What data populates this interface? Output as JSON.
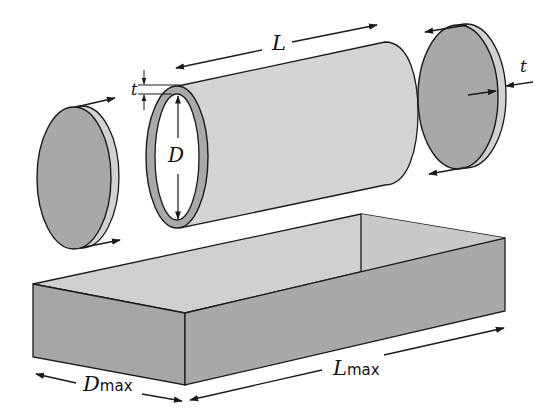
{
  "diagram": {
    "type": "exploded cylinder and bounding box",
    "labels": {
      "length": "L",
      "thickness_left": "t",
      "diameter": "D",
      "thickness_right": "t",
      "dmax_main": "D",
      "dmax_sub": "max",
      "lmax_main": "L",
      "lmax_sub": "max"
    },
    "components": [
      "left end disc",
      "hollow cylinder",
      "right end disc",
      "open rectangular box"
    ],
    "colors": {
      "disc_face": "#a8a8a8",
      "disc_rim": "#d2d2d2",
      "cylinder_body": "#d4d4d4",
      "tube_wall": "#a9a9a9",
      "box_inner": "#d0d0d0",
      "box_side": "#a6a6a6",
      "stroke": "#1a1a1a"
    }
  }
}
